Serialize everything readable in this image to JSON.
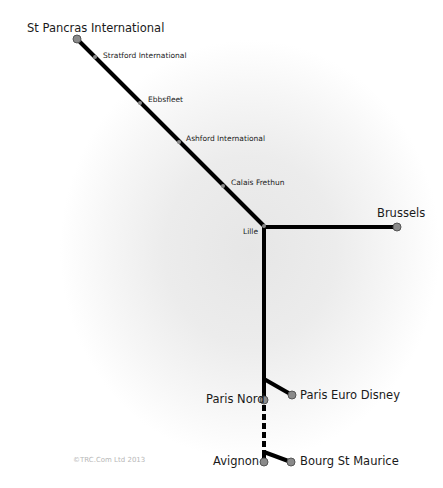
{
  "map": {
    "title": "Eurostar route map",
    "line_color": "#000000",
    "station_dot_color": "#8a8a8a",
    "major_stations": [
      {
        "name": "St Pancras International",
        "x": 77,
        "y": 39
      },
      {
        "name": "Brussels",
        "x": 397,
        "y": 227
      },
      {
        "name": "Paris Nord",
        "x": 264,
        "y": 400
      },
      {
        "name": "Paris Euro Disney",
        "x": 292,
        "y": 395
      },
      {
        "name": "Avignon",
        "x": 264,
        "y": 462
      },
      {
        "name": "Bourg St Maurice",
        "x": 291,
        "y": 462
      }
    ],
    "minor_stations": [
      {
        "name": "Stratford International",
        "x": 95,
        "y": 57
      },
      {
        "name": "Ebbsfleet",
        "x": 140,
        "y": 103
      },
      {
        "name": "Ashford International",
        "x": 179,
        "y": 142
      },
      {
        "name": "Calais Frethun",
        "x": 223,
        "y": 186
      },
      {
        "name": "Lille",
        "x": 264,
        "y": 226
      }
    ],
    "copyright": "©TRC.Com Ltd 2013"
  }
}
